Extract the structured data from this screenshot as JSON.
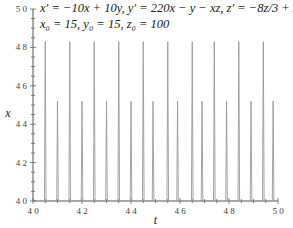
{
  "chart_data": {
    "type": "line",
    "title": "",
    "annotations": [
      "x' = -10x + 10y,    y' = 220x - y - xz,    z' = -8z/3 + xy",
      "x0 = 15,  y0 = 15,  z0 = 100"
    ],
    "xlabel": "t",
    "ylabel": "x",
    "xlim": [
      40,
      50
    ],
    "ylim": [
      40,
      50
    ],
    "x_ticks": [
      "40",
      "42",
      "44",
      "46",
      "48",
      "50"
    ],
    "y_ticks": [
      "40",
      "42",
      "44",
      "46",
      "48",
      "50"
    ],
    "grid": false,
    "legend": null,
    "series": [
      {
        "name": "x(t)",
        "description": "periodic spikes, clipped at baseline 40",
        "tall_peaks": {
          "t": [
            40.5,
            41.5,
            42.5,
            43.5,
            44.5,
            45.5,
            46.5,
            47.4,
            48.4,
            49.4
          ],
          "x": 48.3
        },
        "short_peaks": {
          "t": [
            41.0,
            42.0,
            43.0,
            44.0,
            44.9,
            45.9,
            46.9,
            47.9,
            48.9,
            49.8
          ],
          "x": 45.2
        }
      }
    ]
  },
  "equations": {
    "line1": "x′ = −10x + 10y,    y′ = 220x − y − xz,    z′ = −8z/3 + xy",
    "line2": "x₀ = 15,  y₀ = 15,  z₀ = 100"
  }
}
